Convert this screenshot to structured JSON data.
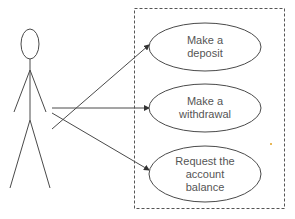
{
  "diagram": {
    "type": "uml-use-case",
    "colors": {
      "line": "#4a4a4a",
      "text": "#555555",
      "background": "#ffffff"
    },
    "actor": {
      "name": "",
      "head": {
        "cx": 30,
        "cy": 44,
        "rx": 9,
        "ry": 15
      },
      "body": {
        "x1": 30,
        "y1": 59,
        "x2": 30,
        "y2": 120
      },
      "arm_left": {
        "x1": 30,
        "y1": 70,
        "x2": 14,
        "y2": 112
      },
      "arm_right": {
        "x1": 30,
        "y1": 70,
        "x2": 46,
        "y2": 112
      },
      "leg_left": {
        "x1": 30,
        "y1": 120,
        "x2": 10,
        "y2": 188
      },
      "leg_right": {
        "x1": 30,
        "y1": 120,
        "x2": 50,
        "y2": 188
      }
    },
    "system_boundary": {
      "x": 134,
      "y": 8,
      "width": 150,
      "height": 200,
      "style": "dashed"
    },
    "use_cases": [
      {
        "id": "deposit",
        "lines": [
          "Make a",
          "deposit"
        ],
        "cx": 205,
        "cy": 47,
        "rx": 56,
        "ry": 24
      },
      {
        "id": "withdrawal",
        "lines": [
          "Make a",
          "withdrawal"
        ],
        "cx": 205,
        "cy": 108,
        "rx": 56,
        "ry": 24
      },
      {
        "id": "balance",
        "lines": [
          "Request the",
          "account",
          "balance"
        ],
        "cx": 205,
        "cy": 174,
        "rx": 56,
        "ry": 28
      }
    ],
    "associations": [
      {
        "from": "actor",
        "to": "deposit",
        "x1": 52,
        "y1": 129,
        "x2": 149,
        "y2": 45,
        "arrow": "filled"
      },
      {
        "from": "actor",
        "to": "withdrawal",
        "x1": 52,
        "y1": 108,
        "x2": 149,
        "y2": 108,
        "arrow": "filled"
      },
      {
        "from": "actor",
        "to": "balance",
        "x1": 52,
        "y1": 113,
        "x2": 149,
        "y2": 170,
        "arrow": "filled"
      }
    ]
  }
}
